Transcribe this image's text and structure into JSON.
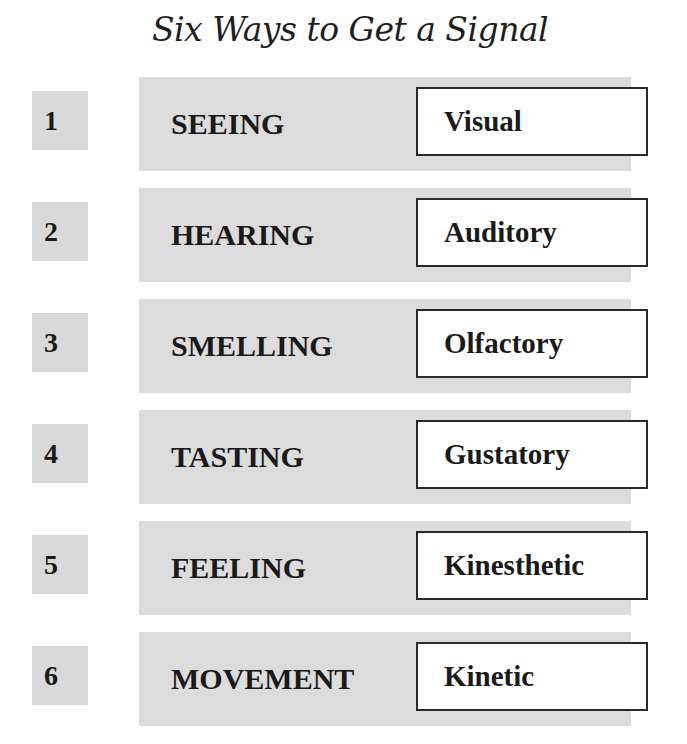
{
  "title": "Six Ways to Get a Signal",
  "rows": [
    {
      "number": "1",
      "sense": "SEEING",
      "term": "Visual"
    },
    {
      "number": "2",
      "sense": "HEARING",
      "term": "Auditory"
    },
    {
      "number": "3",
      "sense": "SMELLING",
      "term": "Olfactory"
    },
    {
      "number": "4",
      "sense": "TASTING",
      "term": "Gustatory"
    },
    {
      "number": "5",
      "sense": "FEELING",
      "term": "Kinesthetic"
    },
    {
      "number": "6",
      "sense": "MOVEMENT",
      "term": "Kinetic"
    }
  ],
  "colors": {
    "band": "#dcdcdc",
    "number_box": "#d9d9d9",
    "term_box_border": "#2a2a2a"
  }
}
